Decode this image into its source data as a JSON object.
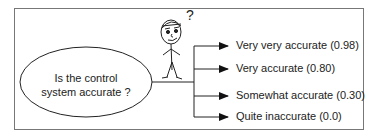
{
  "question": {
    "line1": "Is the control",
    "line2": "system accurate ?"
  },
  "figure": {
    "thought": "?"
  },
  "options": [
    {
      "label": "Very very accurate (0.98)"
    },
    {
      "label": "Very accurate (0.80)"
    },
    {
      "label": "Somewhat accurate (0.30)"
    },
    {
      "label": "Quite inaccurate (0.0)"
    }
  ],
  "colors": {
    "stroke": "#222222",
    "frame": "#777777",
    "background": "#ffffff"
  }
}
